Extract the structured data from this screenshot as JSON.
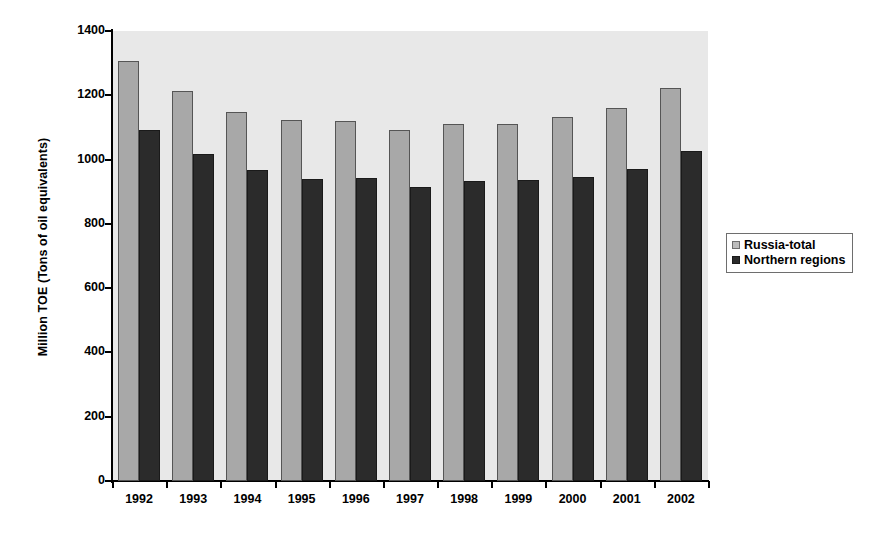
{
  "chart_data": {
    "type": "bar",
    "title": "",
    "xlabel": "",
    "ylabel": "Million TOE (Tons of oil equivalents)",
    "categories": [
      "1992",
      "1993",
      "1994",
      "1995",
      "1996",
      "1997",
      "1998",
      "1999",
      "2000",
      "2001",
      "2002"
    ],
    "series": [
      {
        "name": "Russia-total",
        "color": "#a8a8a8",
        "values": [
          1306,
          1212,
          1148,
          1122,
          1120,
          1092,
          1111,
          1112,
          1131,
          1160,
          1223
        ]
      },
      {
        "name": "Northern regions",
        "color": "#2b2b2b",
        "values": [
          1091,
          1018,
          968,
          940,
          943,
          916,
          933,
          935,
          946,
          972,
          1027
        ]
      }
    ],
    "ylim": [
      0,
      1400
    ],
    "yticks": [
      0,
      200,
      400,
      600,
      800,
      1000,
      1200,
      1400
    ],
    "ytick_labels": [
      "0",
      "200",
      "400",
      "600",
      "800",
      "1000",
      "1200",
      "1400"
    ],
    "grid": false,
    "legend_position": "right",
    "plot_background": "#e8e8e8"
  },
  "legend": {
    "entries": [
      {
        "label": "Russia-total"
      },
      {
        "label": "Northern regions"
      }
    ]
  }
}
